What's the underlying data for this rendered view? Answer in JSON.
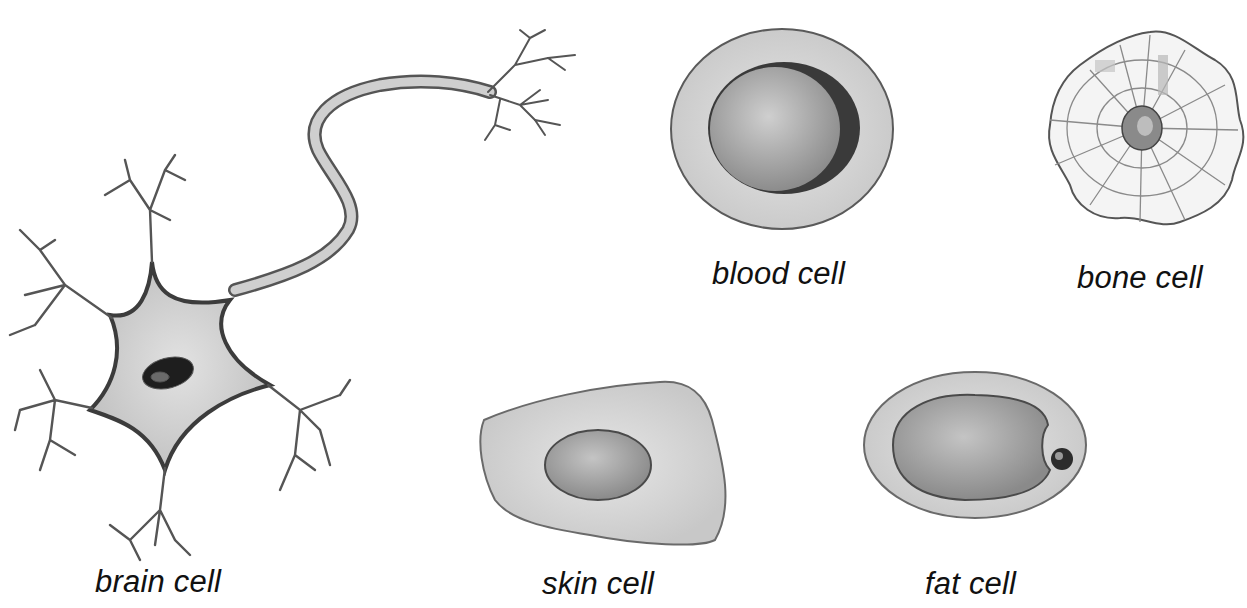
{
  "diagram": {
    "cells": [
      {
        "id": "brain",
        "label": "brain cell"
      },
      {
        "id": "blood",
        "label": "blood cell"
      },
      {
        "id": "bone",
        "label": "bone cell"
      },
      {
        "id": "skin",
        "label": "skin cell"
      },
      {
        "id": "fat",
        "label": "fat cell"
      }
    ],
    "colors": {
      "background": "#ffffff",
      "outline": "#4a4a4a",
      "cytoplasm": "#d4d4d4",
      "nucleus": "#9a9a9a",
      "dark_nucleus": "#1e1e1e",
      "label": "#111111"
    }
  }
}
